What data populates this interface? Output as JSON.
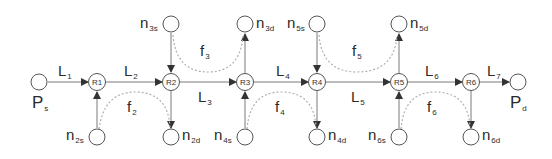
{
  "diagram": {
    "type": "network-flow",
    "colors": {
      "line": "#7a7a7a",
      "dotted": "#b0b0b0",
      "node_stroke": "#555555",
      "text": "#2a2a2a"
    },
    "endpoints": [
      {
        "id": "Ps",
        "base": "P",
        "sub": "s"
      },
      {
        "id": "Pd",
        "base": "P",
        "sub": "d"
      }
    ],
    "routers": [
      {
        "id": "R1",
        "label": "R1"
      },
      {
        "id": "R2",
        "label": "R2"
      },
      {
        "id": "R3",
        "label": "R3"
      },
      {
        "id": "R4",
        "label": "R4"
      },
      {
        "id": "R5",
        "label": "R5"
      },
      {
        "id": "R6",
        "label": "R6"
      }
    ],
    "links": [
      {
        "base": "L",
        "sub": "1"
      },
      {
        "base": "L",
        "sub": "2"
      },
      {
        "base": "L",
        "sub": "3"
      },
      {
        "base": "L",
        "sub": "4"
      },
      {
        "base": "L",
        "sub": "5"
      },
      {
        "base": "L",
        "sub": "6"
      },
      {
        "base": "L",
        "sub": "7"
      }
    ],
    "side_nodes": [
      {
        "id": "n2s",
        "base": "n",
        "sub": "2s"
      },
      {
        "id": "n2d",
        "base": "n",
        "sub": "2d"
      },
      {
        "id": "n3s",
        "base": "n",
        "sub": "3s"
      },
      {
        "id": "n3d",
        "base": "n",
        "sub": "3d"
      },
      {
        "id": "n4s",
        "base": "n",
        "sub": "4s"
      },
      {
        "id": "n4d",
        "base": "n",
        "sub": "4d"
      },
      {
        "id": "n5s",
        "base": "n",
        "sub": "5s"
      },
      {
        "id": "n5d",
        "base": "n",
        "sub": "5d"
      },
      {
        "id": "n6s",
        "base": "n",
        "sub": "6s"
      },
      {
        "id": "n6d",
        "base": "n",
        "sub": "6d"
      }
    ],
    "flows": [
      {
        "base": "f",
        "sub": "2"
      },
      {
        "base": "f",
        "sub": "3"
      },
      {
        "base": "f",
        "sub": "4"
      },
      {
        "base": "f",
        "sub": "5"
      },
      {
        "base": "f",
        "sub": "6"
      }
    ]
  }
}
